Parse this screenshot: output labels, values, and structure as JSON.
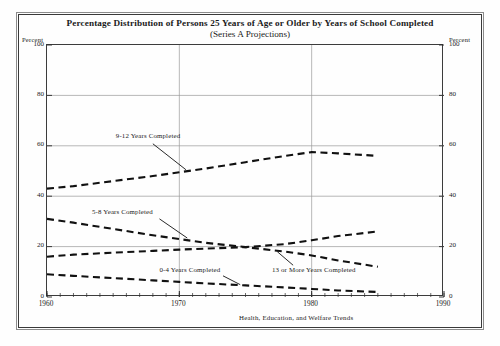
{
  "title": {
    "line1": "Percentage Distribution of Persons 25 Years of Age or Older by Years of School Completed",
    "line2": "(Series A Projections)"
  },
  "axis_caption_left": "Percent",
  "axis_caption_right": "Percent",
  "source_note": "Health, Education, and Welfare Trends",
  "chart_data": {
    "type": "line",
    "title": "Percentage Distribution of Persons 25 Years of Age or Older by Years of School Completed (Series A Projections)",
    "subtitle": "(Series A Projections)",
    "xlabel": "",
    "ylabel": "Percent",
    "ylabel_right": "Percent",
    "xlim": [
      1960,
      1990
    ],
    "ylim": [
      0,
      100
    ],
    "yticks": [
      0,
      20,
      40,
      60,
      80,
      100
    ],
    "ytick_labels": [
      "0",
      "20",
      "40",
      "60",
      "80",
      "100"
    ],
    "ytick_labels_right": [
      "0",
      "20",
      "40",
      "60",
      "80",
      "100"
    ],
    "xticks": [
      1960,
      1970,
      1980,
      1990
    ],
    "xtick_labels": [
      "1960",
      "1970",
      "1980",
      "1990"
    ],
    "x_minor_tick_interval": 1,
    "grid": "horizontal",
    "legend": "inline-annotations",
    "series": [
      {
        "name": "9-12 Years Completed",
        "style": "dashed",
        "x": [
          1960,
          1962,
          1965,
          1968,
          1970,
          1972,
          1975,
          1978,
          1980,
          1982,
          1985
        ],
        "values": [
          43,
          44,
          46,
          48,
          49.5,
          51,
          53.5,
          56,
          57.5,
          57,
          56
        ]
      },
      {
        "name": "5-8 Years Completed",
        "style": "dashed",
        "x": [
          1960,
          1962,
          1965,
          1968,
          1970,
          1972,
          1975,
          1978,
          1980,
          1982,
          1985
        ],
        "values": [
          31,
          29.5,
          27,
          24.5,
          23,
          21.5,
          19.8,
          18,
          16.5,
          14.5,
          12
        ]
      },
      {
        "name": "13 or More Years Completed",
        "style": "dashed",
        "x": [
          1960,
          1962,
          1965,
          1968,
          1970,
          1972,
          1975,
          1978,
          1980,
          1982,
          1985
        ],
        "values": [
          16,
          16.8,
          17.6,
          18.3,
          18.8,
          19.2,
          19.8,
          21,
          22.5,
          24.2,
          26
        ]
      },
      {
        "name": "0-4 Years Completed",
        "style": "dashed",
        "x": [
          1960,
          1962,
          1965,
          1968,
          1970,
          1972,
          1975,
          1978,
          1980,
          1982,
          1985
        ],
        "values": [
          9,
          8.4,
          7.5,
          6.6,
          6.0,
          5.4,
          4.6,
          3.8,
          3.2,
          2.6,
          2.0
        ]
      }
    ],
    "annotations": [
      {
        "text": "9-12 Years Completed",
        "label_x": 1965.2,
        "label_y": 63.5,
        "leader_from": [
          1968.0,
          60.8
        ],
        "leader_to": [
          1970.5,
          50.5
        ]
      },
      {
        "text": "5-8 Years Completed",
        "label_x": 1963.4,
        "label_y": 33.2,
        "leader_from": [
          1968.5,
          31.0
        ],
        "leader_to": [
          1970.6,
          23.4
        ]
      },
      {
        "text": "0-4 Years Completed",
        "label_x": 1968.5,
        "label_y": 10.2,
        "leader_from": [
          1973.3,
          8.4
        ],
        "leader_to": [
          1974.6,
          4.9
        ]
      },
      {
        "text": "13 or More Years Completed",
        "label_x": 1977.0,
        "label_y": 10.2,
        "leader_from": [
          1978.6,
          12.6
        ],
        "leader_to": [
          1977.4,
          18.0
        ]
      }
    ]
  }
}
